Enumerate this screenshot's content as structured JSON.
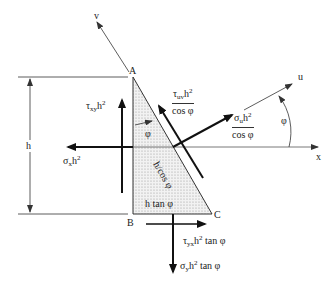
{
  "axes": {
    "v": "v",
    "u": "u",
    "x": "x"
  },
  "vertices": {
    "A": "A",
    "B": "B",
    "C": "C"
  },
  "dimensions": {
    "height": "h",
    "hypotenuse": "h/cos φ",
    "base": "h tan φ",
    "angle_inner": "φ",
    "angle_outer": "φ"
  },
  "forces": {
    "tau_xy": {
      "sym": "τ",
      "sub": "xy",
      "rest": "h",
      "sup": "2"
    },
    "sigma_x": {
      "sym": "σ",
      "sub": "x",
      "rest": "h",
      "sup": "2"
    },
    "tau_uv": {
      "sym": "τ",
      "sub": "uv",
      "rest": "h",
      "sup": "2",
      "den": "cos φ"
    },
    "sigma_u": {
      "sym": "σ",
      "sub": "u",
      "rest": "h",
      "sup": "2",
      "den": "cos φ"
    },
    "tau_yx": {
      "sym": "τ",
      "sub": "yx",
      "rest": "h",
      "sup": "2",
      "tail": " tan φ"
    },
    "sigma_y": {
      "sym": "σ",
      "sub": "y",
      "rest": "h",
      "sup": "2",
      "tail": " tan φ"
    }
  },
  "colors": {
    "line": "#333333",
    "heavy": "#111111",
    "fill": "#e6e6e6"
  }
}
